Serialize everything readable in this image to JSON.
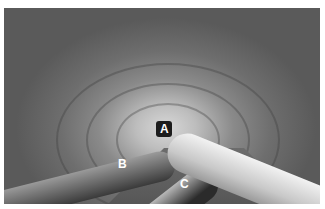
{
  "image": {
    "description": "Grayscale endoscopic view of a tubular lumen with instruments",
    "labels": [
      {
        "id": "A",
        "text": "A"
      },
      {
        "id": "B",
        "text": "B"
      },
      {
        "id": "C",
        "text": "C"
      }
    ]
  }
}
